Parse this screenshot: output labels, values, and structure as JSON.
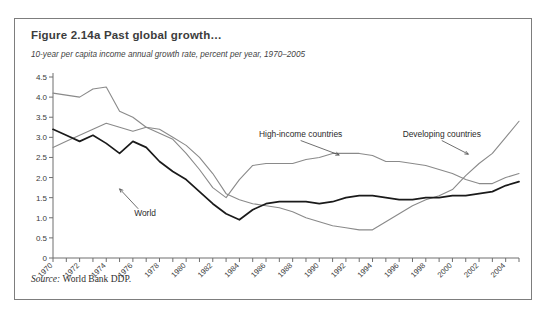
{
  "figure": {
    "title": "Figure 2.14a  Past global growth…",
    "subtitle": "10-year per capita income annual growth rate, percent per year, 1970–2005",
    "source_label": "Source:",
    "source_text": "World Bank DDP."
  },
  "colors": {
    "frame": "#7d7d7d",
    "axis": "#6f6f6f",
    "world_line": "#1a1a1a",
    "high_income_line": "#8a8a8a",
    "developing_line": "#8a8a8a",
    "text": "#3a3a3a",
    "background": "#ffffff"
  },
  "annotations": [
    {
      "name": "world",
      "text": "World",
      "x": 1976.1,
      "y": 1.05,
      "tip_x": 1975.0,
      "tip_y": 1.72
    },
    {
      "name": "high-income",
      "text": "High-income countries",
      "x": 1988.6,
      "y": 3.02,
      "tip_x": 1991.5,
      "tip_y": 2.56
    },
    {
      "name": "developing",
      "text": "Developing countries",
      "x": 1999.2,
      "y": 3.02,
      "tip_x": 2001.2,
      "tip_y": 2.58
    }
  ],
  "chart_data": {
    "type": "line",
    "title": "Figure 2.14a  Past global growth…",
    "subtitle": "10-year per capita income annual growth rate, percent per year, 1970–2005",
    "xlabel": "",
    "ylabel": "",
    "xlim": [
      1970,
      2005
    ],
    "ylim": [
      0,
      4.5
    ],
    "ytick_step": 0.5,
    "yticks": [
      "0",
      "0.5",
      "1.0",
      "1.5",
      "2.0",
      "2.5",
      "3.0",
      "3.5",
      "4.0",
      "4.5"
    ],
    "xticks_all_years": true,
    "xtick_labels": [
      "1970",
      "1972",
      "1974",
      "1976",
      "1978",
      "1980",
      "1982",
      "1984",
      "1986",
      "1988",
      "1990",
      "1992",
      "1994",
      "1996",
      "1998",
      "2000",
      "2002",
      "2004"
    ],
    "grid": false,
    "legend": "inline-annotations",
    "x": [
      1970,
      1971,
      1972,
      1973,
      1974,
      1975,
      1976,
      1977,
      1978,
      1979,
      1980,
      1981,
      1982,
      1983,
      1984,
      1985,
      1986,
      1987,
      1988,
      1989,
      1990,
      1991,
      1992,
      1993,
      1994,
      1995,
      1996,
      1997,
      1998,
      1999,
      2000,
      2001,
      2002,
      2003,
      2004,
      2005
    ],
    "series": [
      {
        "name": "High-income countries",
        "color": "#8a8a8a",
        "values": [
          4.1,
          4.05,
          4.0,
          4.2,
          4.25,
          3.65,
          3.5,
          3.25,
          3.1,
          2.95,
          2.6,
          2.2,
          1.75,
          1.5,
          1.95,
          2.3,
          2.35,
          2.35,
          2.35,
          2.45,
          2.5,
          2.6,
          2.6,
          2.6,
          2.55,
          2.4,
          2.4,
          2.35,
          2.3,
          2.2,
          2.1,
          1.95,
          1.85,
          1.85,
          2.0,
          2.1
        ]
      },
      {
        "name": "Developing countries",
        "color": "#8a8a8a",
        "values": [
          2.75,
          2.9,
          3.05,
          3.2,
          3.35,
          3.25,
          3.15,
          3.25,
          3.2,
          3.0,
          2.8,
          2.5,
          2.1,
          1.6,
          1.45,
          1.35,
          1.3,
          1.25,
          1.15,
          1.0,
          0.9,
          0.8,
          0.75,
          0.7,
          0.7,
          0.9,
          1.1,
          1.3,
          1.45,
          1.55,
          1.7,
          2.05,
          2.35,
          2.6,
          3.0,
          3.4
        ]
      },
      {
        "name": "World",
        "color": "#1a1a1a",
        "values": [
          3.2,
          3.05,
          2.9,
          3.05,
          2.85,
          2.6,
          2.9,
          2.75,
          2.4,
          2.15,
          1.95,
          1.65,
          1.35,
          1.1,
          0.95,
          1.2,
          1.35,
          1.4,
          1.4,
          1.4,
          1.35,
          1.4,
          1.5,
          1.55,
          1.55,
          1.5,
          1.45,
          1.45,
          1.5,
          1.5,
          1.55,
          1.55,
          1.6,
          1.65,
          1.8,
          1.9
        ]
      }
    ]
  }
}
